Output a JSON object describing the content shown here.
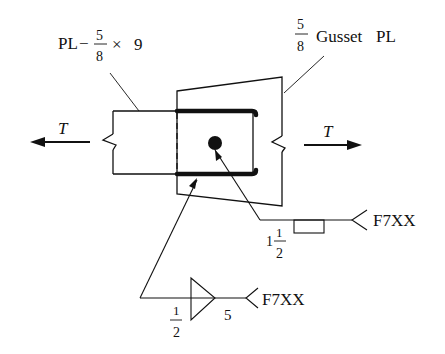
{
  "diagram": {
    "type": "welded connection detail",
    "labels": {
      "splice_plate": {
        "prefix": "PL",
        "dash": "−",
        "frac_num": "5",
        "frac_den": "8",
        "times": "×",
        "width": "9"
      },
      "gusset_plate": {
        "frac_num": "5",
        "frac_den": "8",
        "text": "Gusset",
        "suffix": "PL"
      },
      "tension_left": "T",
      "tension_right": "T",
      "plug_weld": {
        "whole": "1",
        "frac_num": "1",
        "frac_den": "2",
        "electrode": "F7XX"
      },
      "fillet_weld": {
        "frac_num": "1",
        "frac_den": "2",
        "length": "5",
        "electrode": "F7XX"
      }
    },
    "colors": {
      "line": "#111111",
      "background": "#ffffff"
    }
  }
}
